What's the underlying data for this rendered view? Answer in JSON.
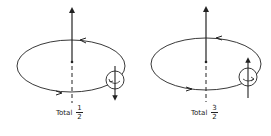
{
  "figure": {
    "stroke_color": "#222222",
    "panels": [
      {
        "id": "left",
        "orbital_arrow": "up",
        "spin_arrow": "down",
        "label": "Total",
        "fraction": {
          "numerator": "1",
          "denominator": "2"
        }
      },
      {
        "id": "right",
        "orbital_arrow": "up",
        "spin_arrow": "up",
        "label": "Total",
        "fraction": {
          "numerator": "3",
          "denominator": "2"
        }
      }
    ]
  }
}
